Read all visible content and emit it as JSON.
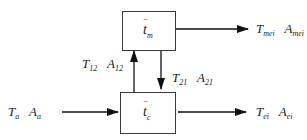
{
  "diagram": {
    "nodes": {
      "top": {
        "symbol": "t",
        "subscript": "m",
        "overbar": "‾"
      },
      "bottom": {
        "symbol": "t",
        "subscript": "c",
        "overbar": "‾"
      }
    },
    "edges": {
      "input": {
        "label1_main": "T",
        "label1_sub": "a",
        "label2_main": "A",
        "label2_sub": "a"
      },
      "output_bottom": {
        "label1_main": "T",
        "label1_sub": "ei",
        "label2_main": "A",
        "label2_sub": "ei"
      },
      "output_top": {
        "label1_main": "T",
        "label1_sub": "mei",
        "label2_main": "A",
        "label2_sub": "mei"
      },
      "up_c_to_m": {
        "label1_main": "T",
        "label1_sub": "12",
        "label2_main": "A",
        "label2_sub": "12"
      },
      "down_m_to_c": {
        "label1_main": "T",
        "label1_sub": "21",
        "label2_main": "A",
        "label2_sub": "21"
      }
    },
    "colors": {
      "line": "#111111",
      "box_border": "#3a3a3a",
      "text": "#222222"
    }
  }
}
